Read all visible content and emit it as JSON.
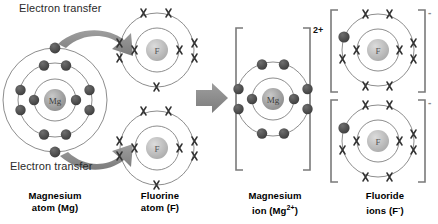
{
  "diagram": {
    "background": "#ffffff",
    "colors": {
      "shell_line": "#8d8d8d",
      "electron_dot": "#4a4a4a",
      "electron_cross": "#3a3a3a",
      "nucleus_fill": "#9a9a9a",
      "arrow_grey": "#8a8a8a",
      "bracket": "#7a7a7a",
      "text": "#111111"
    }
  },
  "annotations": {
    "electron_transfer_top": "Electron transfer",
    "electron_transfer_bottom": "Electron transfer",
    "reaction_arrow": "reaction-arrow"
  },
  "species": {
    "magnesium_atom": {
      "nucleus_label": "Mg",
      "shells": [
        2,
        8,
        2
      ],
      "electron_symbol": "dot",
      "caption_line1": "Magnesium",
      "caption_line2": "atom (Mg)"
    },
    "fluorine_atom": {
      "nucleus_label": "F",
      "shells": [
        2,
        7
      ],
      "electron_symbol": "cross",
      "count": 2,
      "caption_line1": "Fluorine",
      "caption_line2": "atom (F)"
    },
    "magnesium_ion": {
      "nucleus_label": "Mg",
      "shells": [
        2,
        8
      ],
      "electron_symbol": "dot",
      "charge": "2+",
      "bracketed": true,
      "caption_line1": "Magnesium",
      "caption_line2_pre": "ion (Mg",
      "caption_charge": "2+",
      "caption_line2_post": ")"
    },
    "fluoride_ion": {
      "nucleus_label": "F",
      "shells": [
        2,
        8
      ],
      "electron_symbol": "cross",
      "transferred_electron_symbol": "dot",
      "transferred_count": 1,
      "charge": "-",
      "bracketed": true,
      "count": 2,
      "caption_line1": "Fluoride",
      "caption_line2_pre": "ions (F",
      "caption_charge": "-",
      "caption_line2_post": ")"
    }
  }
}
